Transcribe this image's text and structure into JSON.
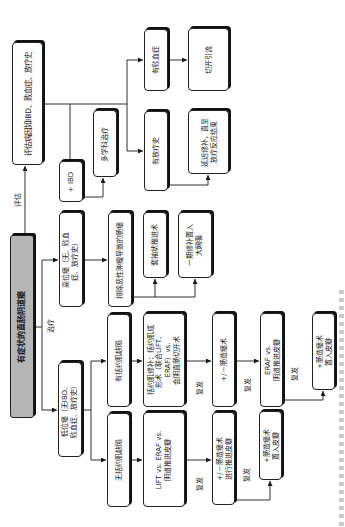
{
  "diagram": {
    "title": "有症状的直肠阴道瘘",
    "nodes": {
      "root": {
        "label": "有症状的直肠阴道瘘",
        "fill": "#b6b6b6"
      },
      "evaluate": {
        "label": "评估病因如IBD、败血症、放疗史"
      },
      "ibd": {
        "label": "+ IBD"
      },
      "multidisciplinary": {
        "label": "多学科治疗"
      },
      "sepsis": {
        "label": "有败血症"
      },
      "drainage": {
        "label": "切开引流"
      },
      "radiation": {
        "label": "有放疗史"
      },
      "delayed_repair": {
        "label": "延迟修补，直至\n放疗反应结束"
      },
      "high_fistula": {
        "label": "高位瘘（无、败血\n症、放疗史）"
      },
      "exclude_malignancy": {
        "label": "排除恶性肿瘤导致的肠瘘"
      },
      "sleeve_advancement": {
        "label": "套袖状推进术"
      },
      "omentum": {
        "label": "一期修补置入\n大网膜"
      },
      "low_fistula": {
        "label": "低位瘘（无IBD、\n败血症、放疗史）"
      },
      "sphincter_defect": {
        "label": "有括约肌缺陷"
      },
      "no_sphincter_defect": {
        "label": "无括约肌缺陷"
      },
      "sphincter_repair": {
        "label": "括约肌修补：括约肌成\n形术（联合LIFT、\nERAF）vs.\n会阴直肠切开术"
      },
      "lift_eraf_flap": {
        "label": "LIFT vs. ERAF vs.\n阴道推进皮瓣"
      },
      "diversion_1": {
        "label": "+/－肠造瘘术"
      },
      "diversion_advancement": {
        "label": "+/－肠造瘘术\n进行推进皮瓣"
      },
      "eraf_or_flap": {
        "label": "ERAF vs.\n阴道推进皮瓣"
      },
      "diversion_flap_low": {
        "label": "+肠造瘘术\n置入皮瓣"
      },
      "diversion_flap_up": {
        "label": "+肠造瘘术\n置入皮瓣"
      }
    },
    "edges": [
      {
        "from": "root",
        "to": "evaluate",
        "label": "评估"
      },
      {
        "from": "evaluate",
        "to": "ibd"
      },
      {
        "from": "evaluate",
        "to": "sepsis"
      },
      {
        "from": "evaluate",
        "to": "radiation"
      },
      {
        "from": "sepsis",
        "to": "drainage"
      },
      {
        "from": "radiation",
        "to": "delayed_repair"
      },
      {
        "from": "ibd",
        "to": "multidisciplinary"
      },
      {
        "from": "root",
        "to": "high_fistula",
        "label": "治疗"
      },
      {
        "from": "root",
        "to": "low_fistula"
      },
      {
        "from": "high_fistula",
        "to": "exclude_malignancy"
      },
      {
        "from": "exclude_malignancy",
        "to": "sleeve_advancement"
      },
      {
        "from": "exclude_malignancy",
        "to": "omentum"
      },
      {
        "from": "low_fistula",
        "to": "sphincter_defect"
      },
      {
        "from": "low_fistula",
        "to": "no_sphincter_defect"
      },
      {
        "from": "sphincter_defect",
        "to": "sphincter_repair"
      },
      {
        "from": "sphincter_repair",
        "to": "diversion_1",
        "label": "复发"
      },
      {
        "from": "diversion_1",
        "to": "eraf_or_flap",
        "label": "复发"
      },
      {
        "from": "eraf_or_flap",
        "to": "diversion_flap_up",
        "label": "复发"
      },
      {
        "from": "no_sphincter_defect",
        "to": "lift_eraf_flap"
      },
      {
        "from": "lift_eraf_flap",
        "to": "diversion_advancement",
        "label": "复发"
      },
      {
        "from": "diversion_advancement",
        "to": "diversion_flap_low",
        "label": "复发"
      }
    ],
    "orientation": "rotated-90-ccw",
    "colors": {
      "line": "#1a1a1a",
      "root_fill": "#b6b6b6",
      "box_fill": "#ffffff"
    }
  }
}
